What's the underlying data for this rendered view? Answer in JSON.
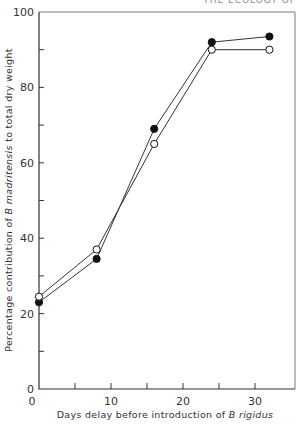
{
  "header": {
    "running_title": "THE ECOLOGY OF"
  },
  "chart_data": {
    "type": "line",
    "title": "",
    "xlabel": "Days delay before introduction of B rigidus",
    "xlabel_plain": "Days delay before introduction of ",
    "xlabel_italic": "B rigidus",
    "ylabel": "Percentage contribution of B madritensis to total dry weight",
    "ylabel_pre": "Percentage contribution of ",
    "ylabel_italic": "B madritensis",
    "ylabel_post": " to total dry weight",
    "xlim": [
      0,
      35
    ],
    "ylim": [
      0,
      100
    ],
    "x_ticks": [
      0,
      10,
      20,
      30
    ],
    "x_tick_labels": [
      "0",
      "10",
      "20",
      "30"
    ],
    "y_ticks": [
      0,
      20,
      40,
      60,
      80,
      100
    ],
    "y_tick_labels": [
      "0",
      "20",
      "40",
      "60",
      "80",
      "100"
    ],
    "grid": false,
    "legend": null,
    "x": [
      0,
      8,
      16,
      24,
      32
    ],
    "series": [
      {
        "name": "filled circles",
        "marker": "filled",
        "values": [
          23,
          34.5,
          69,
          92,
          93.5
        ]
      },
      {
        "name": "open circles",
        "marker": "open",
        "values": [
          24.5,
          37,
          65,
          90,
          90
        ]
      }
    ]
  }
}
